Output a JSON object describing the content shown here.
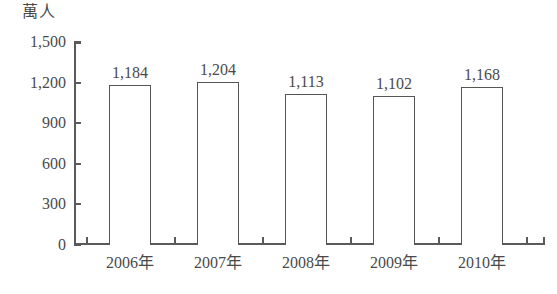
{
  "chart_data": {
    "type": "bar",
    "title": "",
    "subtitle": "",
    "xlabel": "",
    "ylabel": "萬人",
    "unit_caption": "萬人",
    "categories": [
      "2006年",
      "2007年",
      "2008年",
      "2009年",
      "2010年"
    ],
    "values": [
      1184,
      1204,
      1113,
      1102,
      1168
    ],
    "value_labels": [
      "1,184",
      "1,204",
      "1,113",
      "1,102",
      "1,168"
    ],
    "ylim": [
      0,
      1500
    ],
    "yticks": [
      0,
      300,
      600,
      900,
      1200,
      1500
    ],
    "ytick_labels": [
      "0",
      "300",
      "600",
      "900",
      "1,200",
      "1,500"
    ],
    "grid": false,
    "legend": null,
    "legend_position": "none",
    "bar_fill_color": "#ffffff",
    "bar_border_color": "#555555",
    "axis_color": "#5a5a5a",
    "text_color": "#4a4a4a",
    "background_color": "#ffffff"
  }
}
